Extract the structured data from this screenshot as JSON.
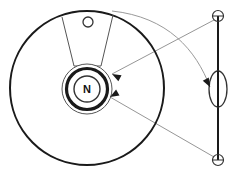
{
  "figure": {
    "kind": "mechanical-schematic-diagram",
    "background_color": "#ffffff",
    "width": 238,
    "height": 173
  },
  "colors": {
    "outline_dark": "#1a1a1a",
    "outline_mid": "#333333",
    "thin_line": "#555555",
    "pointer_grey": "#8a8a8a",
    "curve_grey": "#9a9a9a",
    "label_text": "#111111",
    "fill_white": "#ffffff"
  },
  "labels": {
    "hub_label": "N"
  },
  "parts": {
    "disc": {
      "name": "large-disc",
      "cx": 87,
      "cy": 88,
      "r": 77,
      "stroke_width": 2.0
    },
    "hub_outer_ring": {
      "name": "hub-outer-ring",
      "cx": 87,
      "cy": 89,
      "r": 25,
      "stroke_width": 1.0
    },
    "hub_thick_ring": {
      "name": "hub-thick-ring",
      "cx": 87,
      "cy": 89,
      "r": 20.5,
      "stroke_width": 3.2
    },
    "hub_inner_circle": {
      "name": "hub-inner-circle",
      "cx": 87,
      "cy": 89,
      "r": 13,
      "stroke_width": 1.4
    },
    "sector": {
      "name": "radial-sector-wedge",
      "apex_left_x": 74,
      "apex_left_y": 66,
      "apex_right_x": 101,
      "apex_right_y": 66,
      "rim_left_x": 62,
      "rim_left_y": 17,
      "rim_right_x": 113,
      "rim_right_y": 15,
      "stroke_width": 1.0
    },
    "pin_circle": {
      "name": "rim-pin-circle",
      "cx": 88,
      "cy": 22,
      "r": 5,
      "stroke_width": 1.3
    },
    "shaft": {
      "name": "vertical-shaft",
      "x": 218,
      "y_top": 16,
      "y_bottom": 160,
      "stroke_width": 2.0
    },
    "shaft_top_circle": {
      "name": "shaft-top-joint-circle",
      "cx": 218,
      "cy": 16,
      "r": 5.5,
      "stroke_width": 1.2
    },
    "shaft_bottom_circle": {
      "name": "shaft-bottom-joint-circle",
      "cx": 218,
      "cy": 160,
      "r": 5.5,
      "stroke_width": 1.2
    },
    "shaft_ellipse": {
      "name": "shaft-ellipse-element",
      "cx": 218,
      "cy": 89,
      "rx": 9,
      "ry": 18,
      "stroke_width": 1.3
    }
  },
  "leaders": {
    "curve_from_rim_to_ellipse": {
      "name": "leader-curve-rim-to-ellipse",
      "start_x": 112,
      "start_y": 11,
      "c1_x": 168,
      "c1_y": 17,
      "c2_x": 196,
      "c2_y": 50,
      "end_x": 210,
      "end_y": 87,
      "stroke_width": 1.0
    },
    "line_top_joint_to_hub": {
      "name": "leader-line-top-joint-to-hub",
      "start_x": 214,
      "start_y": 20,
      "end_x": 112,
      "end_y": 74,
      "stroke_width": 0.9
    },
    "line_bottom_joint_to_hub": {
      "name": "leader-line-bottom-joint-to-hub",
      "start_x": 214,
      "start_y": 157,
      "end_x": 110,
      "end_y": 97,
      "stroke_width": 0.9
    }
  },
  "arrowheads": [
    {
      "name": "arrowhead-upper-hub",
      "x": 112,
      "y": 74,
      "angle_deg": 208
    },
    {
      "name": "arrowhead-lower-hub",
      "x": 110,
      "y": 97,
      "angle_deg": 150
    },
    {
      "name": "arrowhead-ellipse",
      "x": 210,
      "y": 87,
      "angle_deg": 62
    }
  ]
}
